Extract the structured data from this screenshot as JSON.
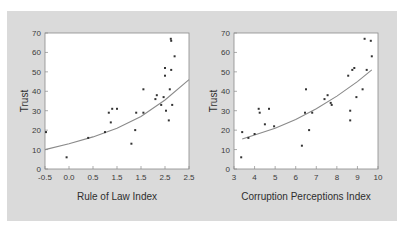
{
  "colors": {
    "panel_bg": "#dadada",
    "plot_bg": "#ffffff",
    "axis": "#8a8a8a",
    "points": "#333333",
    "fit_line": "#888888"
  },
  "chart_data": [
    {
      "type": "scatter",
      "title": "",
      "xlabel": "Rule of Law Index",
      "ylabel": "Trust",
      "xlim": [
        -0.5,
        2.5
      ],
      "ylim": [
        0,
        70
      ],
      "x_tick_labels": [
        "-0.5",
        "0.0",
        "0.5",
        "1.5",
        "1.5",
        "2.5",
        "2.5"
      ],
      "y_tick_labels": [
        "0",
        "10",
        "20",
        "30",
        "40",
        "50",
        "60",
        "70"
      ],
      "grid": false,
      "points": [
        [
          -0.48,
          19
        ],
        [
          -0.05,
          6
        ],
        [
          0.4,
          16
        ],
        [
          0.75,
          19
        ],
        [
          0.83,
          29
        ],
        [
          0.87,
          24
        ],
        [
          0.9,
          31
        ],
        [
          1.0,
          31
        ],
        [
          1.3,
          13
        ],
        [
          1.38,
          20
        ],
        [
          1.4,
          29
        ],
        [
          1.55,
          29
        ],
        [
          1.55,
          41
        ],
        [
          1.8,
          36
        ],
        [
          1.83,
          38
        ],
        [
          1.92,
          33
        ],
        [
          1.97,
          37
        ],
        [
          2.0,
          48
        ],
        [
          2.0,
          52
        ],
        [
          2.02,
          30
        ],
        [
          2.08,
          25
        ],
        [
          2.1,
          41
        ],
        [
          2.13,
          51
        ],
        [
          2.15,
          33
        ],
        [
          2.12,
          67
        ],
        [
          2.13,
          66
        ],
        [
          2.2,
          58
        ]
      ],
      "fit_curve": {
        "type": "exponential",
        "x": [
          -0.5,
          0.0,
          0.5,
          1.0,
          1.5,
          2.0,
          2.5
        ],
        "y": [
          10,
          13,
          16.5,
          21,
          27,
          35.5,
          46
        ]
      }
    },
    {
      "type": "scatter",
      "title": "",
      "xlabel": "Corruption Perceptions Index",
      "ylabel": "Trust",
      "xlim": [
        3,
        10
      ],
      "ylim": [
        0,
        70
      ],
      "x_tick_labels": [
        "3",
        "4",
        "5",
        "6",
        "7",
        "8",
        "9",
        "10"
      ],
      "y_tick_labels": [
        "0",
        "10",
        "20",
        "30",
        "40",
        "50",
        "60",
        "70"
      ],
      "grid": false,
      "points": [
        [
          3.35,
          6
        ],
        [
          3.4,
          19
        ],
        [
          3.7,
          16
        ],
        [
          4.0,
          18
        ],
        [
          4.2,
          31
        ],
        [
          4.25,
          29
        ],
        [
          4.5,
          23
        ],
        [
          4.7,
          31
        ],
        [
          4.95,
          22
        ],
        [
          6.3,
          12
        ],
        [
          6.45,
          29
        ],
        [
          6.5,
          41
        ],
        [
          6.65,
          20
        ],
        [
          6.8,
          29
        ],
        [
          7.4,
          36
        ],
        [
          7.55,
          38
        ],
        [
          7.7,
          34
        ],
        [
          7.75,
          33
        ],
        [
          8.55,
          48
        ],
        [
          8.65,
          30
        ],
        [
          8.65,
          25
        ],
        [
          8.75,
          51
        ],
        [
          8.85,
          52
        ],
        [
          8.95,
          37
        ],
        [
          9.25,
          41
        ],
        [
          9.35,
          67
        ],
        [
          9.45,
          51
        ],
        [
          9.65,
          66
        ],
        [
          9.7,
          58
        ]
      ],
      "fit_curve": {
        "type": "exponential",
        "x": [
          3.4,
          4,
          5,
          6,
          7,
          8,
          9,
          9.7
        ],
        "y": [
          15.5,
          17.5,
          21,
          25.5,
          31,
          37.5,
          45,
          51
        ]
      }
    }
  ]
}
